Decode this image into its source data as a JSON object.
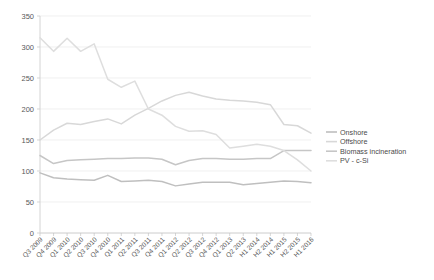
{
  "chart_data": {
    "type": "line",
    "title": "",
    "xlabel": "",
    "ylabel": "",
    "ylim": [
      0,
      350
    ],
    "ytick_step": 50,
    "yticks": [
      "0",
      "50",
      "100",
      "150",
      "200",
      "250",
      "300",
      "350"
    ],
    "grid": true,
    "legend_position": "right",
    "categories": [
      "Q3 2009",
      "Q4 2009",
      "Q1 2010",
      "Q2 2010",
      "Q3 2010",
      "Q4 2010",
      "Q1 2011",
      "Q2 2011",
      "Q3 2011",
      "Q4 2011",
      "Q1 2012",
      "Q2 2012",
      "Q3 2012",
      "Q4 2012",
      "Q1 2013",
      "Q2 2013",
      "H1 2014",
      "H2 2014",
      "H1 2015",
      "H2 2015",
      "H1 2016"
    ],
    "series": [
      {
        "name": "Onshore",
        "color": "#bfbfbf",
        "values": [
          97,
          89,
          87,
          86,
          85,
          93,
          83,
          84,
          85,
          83,
          76,
          79,
          82,
          82,
          82,
          78,
          80,
          82,
          84,
          83,
          81
        ]
      },
      {
        "name": "Offshore",
        "color": "#d8d8d8",
        "values": [
          150,
          166,
          177,
          175,
          180,
          184,
          176,
          190,
          201,
          213,
          222,
          227,
          221,
          216,
          214,
          213,
          211,
          207,
          175,
          173,
          161
        ]
      },
      {
        "name": "Biomass incineration",
        "color": "#c6c6c6",
        "values": [
          125,
          112,
          117,
          118,
          119,
          120,
          120,
          121,
          121,
          119,
          110,
          117,
          120,
          120,
          119,
          119,
          120,
          120,
          133,
          133,
          133
        ]
      },
      {
        "name": "PV - c-Si",
        "color": "#dedede",
        "values": [
          315,
          293,
          314,
          293,
          305,
          248,
          235,
          245,
          200,
          190,
          172,
          164,
          165,
          159,
          137,
          140,
          143,
          140,
          133,
          118,
          100
        ]
      }
    ]
  },
  "legend": {
    "items": [
      {
        "label": "Onshore"
      },
      {
        "label": "Offshore"
      },
      {
        "label": "Biomass incineration"
      },
      {
        "label": "PV - c-Si"
      }
    ]
  }
}
